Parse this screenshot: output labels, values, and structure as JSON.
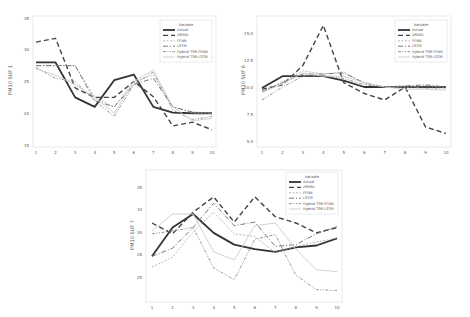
{
  "chart_data": [
    {
      "type": "line",
      "title": "",
      "xlabel": "",
      "ylabel": "PM10 SUF 1",
      "x": [
        1,
        2,
        3,
        4,
        5,
        6,
        7,
        8,
        9,
        10
      ],
      "x_ticks": [
        "1",
        "2",
        "3",
        "4",
        "5",
        "6",
        "7",
        "8",
        "9",
        "10"
      ],
      "y_ticks": [
        "35",
        "30",
        "25",
        "20",
        "15"
      ],
      "ylim": [
        15,
        35
      ],
      "grid": false,
      "legend_title": "Variable",
      "legend_position": "upper right",
      "series": [
        {
          "name": "Actual",
          "values": [
            28,
            28,
            22.5,
            21,
            25.2,
            26.1,
            21,
            20.1,
            20,
            20
          ]
        },
        {
          "name": "ARIMA",
          "values": [
            31.2,
            31.8,
            24,
            22.5,
            22.5,
            25,
            22.6,
            18,
            18.6,
            17.4
          ]
        },
        {
          "name": "FFNN",
          "values": [
            27.5,
            27.5,
            27.5,
            22.5,
            21,
            25,
            26,
            21,
            20,
            20
          ]
        },
        {
          "name": "LSTM",
          "values": [
            27.5,
            27.5,
            27.5,
            22,
            21,
            24.5,
            25.5,
            21,
            20.2,
            20
          ]
        },
        {
          "name": "Hybrid TSR-FFNN",
          "values": [
            27.2,
            25.5,
            25,
            22,
            19.5,
            24.5,
            26.5,
            20.5,
            19,
            19.5
          ]
        },
        {
          "name": "Hybrid TSR-LSTM",
          "values": [
            27,
            26,
            24.5,
            22.5,
            20,
            25,
            26.8,
            21,
            18.8,
            19.2
          ]
        }
      ]
    },
    {
      "type": "line",
      "title": "",
      "xlabel": "",
      "ylabel": "PM10 SUF 6",
      "x": [
        1,
        2,
        3,
        4,
        5,
        6,
        7,
        8,
        9,
        10
      ],
      "x_ticks": [
        "1",
        "2",
        "3",
        "4",
        "5",
        "6",
        "7",
        "8",
        "9",
        "10"
      ],
      "y_ticks": [
        "15.0",
        "12.5",
        "10.0",
        "7.5",
        "5.0"
      ],
      "ylim": [
        5,
        16
      ],
      "grid": false,
      "legend_title": "Variable",
      "legend_position": "upper right",
      "series": [
        {
          "name": "Actual",
          "values": [
            9.9,
            11,
            11,
            11,
            10.6,
            10,
            10,
            10,
            10,
            10
          ]
        },
        {
          "name": "ARIMA",
          "values": [
            9.8,
            10.2,
            12,
            15.7,
            10.4,
            9.4,
            8.8,
            10,
            6.3,
            5.7
          ]
        },
        {
          "name": "FFNN",
          "values": [
            9.5,
            10.5,
            11.5,
            11.2,
            11.4,
            10.3,
            10,
            10,
            10.1,
            10
          ]
        },
        {
          "name": "LSTM",
          "values": [
            9.6,
            10.4,
            11.2,
            11.2,
            11.3,
            10.4,
            10,
            10.1,
            10.2,
            10
          ]
        },
        {
          "name": "Hybrid TSR-FFNN",
          "values": [
            8.8,
            10,
            11,
            11,
            10.8,
            10.2,
            10,
            10,
            9.9,
            9.9
          ]
        },
        {
          "name": "Hybrid TSR-LSTM",
          "values": [
            9.5,
            10.3,
            11.3,
            11,
            11,
            10.4,
            10,
            9.8,
            9.8,
            9.7
          ]
        }
      ]
    },
    {
      "type": "line",
      "title": "",
      "xlabel": "",
      "ylabel": "PM10 SUF 7",
      "x": [
        1,
        2,
        3,
        4,
        5,
        6,
        7,
        8,
        9,
        10
      ],
      "x_ticks": [
        "1",
        "2",
        "3",
        "4",
        "5",
        "6",
        "7",
        "8",
        "9",
        "10"
      ],
      "y_ticks": [
        "35",
        "33",
        "30",
        "28",
        "25"
      ],
      "ylim": [
        22.5,
        37
      ],
      "grid": false,
      "legend_title": "Variable",
      "legend_position": "upper right",
      "series": [
        {
          "name": "Actual",
          "values": [
            27.3,
            30.5,
            32,
            29.9,
            28.6,
            28.1,
            27.8,
            28.3,
            28.5,
            29.3
          ]
        },
        {
          "name": "ARIMA",
          "values": [
            31,
            29.8,
            32.2,
            33.9,
            31.1,
            33.9,
            31.7,
            31,
            29.9,
            30.5
          ]
        },
        {
          "name": "FFNN",
          "values": [
            26.1,
            27.2,
            30,
            32.2,
            29.8,
            29.5,
            27.7,
            28.4,
            28.9,
            29.3
          ]
        },
        {
          "name": "LSTM",
          "values": [
            27.3,
            28.2,
            30.5,
            33.2,
            30.7,
            31.1,
            28.4,
            28.6,
            29.8,
            30.6
          ]
        },
        {
          "name": "Hybrid TSR-FFNN",
          "values": [
            29.8,
            30.1,
            30.5,
            26,
            24.7,
            29.2,
            29.7,
            25.2,
            23.6,
            23.5
          ]
        },
        {
          "name": "Hybrid TSR-LSTM",
          "values": [
            30.1,
            32,
            32,
            27.8,
            26.9,
            30.7,
            31,
            28.1,
            25.8,
            25.6
          ]
        }
      ]
    }
  ],
  "styles": {
    "Actual": {
      "color": "#333333",
      "width": 1.8,
      "dash": ""
    },
    "ARIMA": {
      "color": "#444444",
      "width": 1.4,
      "dash": "5,3"
    },
    "FFNN": {
      "color": "#aaaaaa",
      "width": 0.8,
      "dash": "2,1.5"
    },
    "LSTM": {
      "color": "#777777",
      "width": 1.0,
      "dash": "5,2,1,2"
    },
    "Hybrid TSR-FFNN": {
      "color": "#888888",
      "width": 0.9,
      "dash": "3,1.5,1,1.5,1,1.5"
    },
    "Hybrid TSR-LSTM": {
      "color": "#cccccc",
      "width": 0.9,
      "dash": ""
    }
  }
}
